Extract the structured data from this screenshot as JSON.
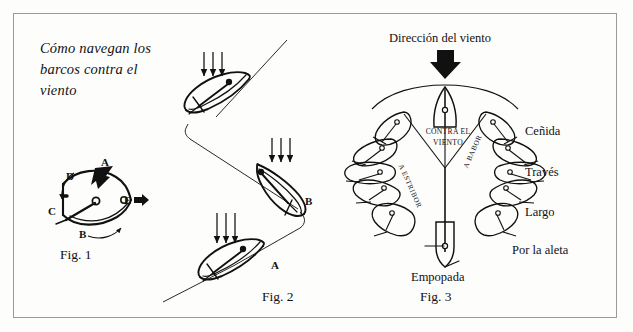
{
  "figure": {
    "title": "Cómo navegan los\nbarcos contra el\nviento",
    "background_color": "#fdfdfc",
    "ink_color": "#111111",
    "border_color": "#9a9a9a"
  },
  "fig1": {
    "caption": "Fig. 1",
    "labels": {
      "a": "A",
      "b": "B",
      "c": "C",
      "d": "D",
      "e": "E"
    }
  },
  "fig2": {
    "caption": "Fig. 2",
    "labels": {
      "a": "A",
      "b": "B"
    },
    "wind_arrow_groups": 3,
    "arrows_per_group": 3,
    "boat_count": 3
  },
  "fig3": {
    "caption": "Fig. 3",
    "wind_direction_label": "Dirección del viento",
    "center_label": "CONTRA EL\nVIENTO",
    "branch_labels": {
      "port": "A ESTRIBOR",
      "starboard": "A BABOR"
    },
    "points_of_sail": [
      "Ceñida",
      "Través",
      "Largo",
      "Por la aleta"
    ],
    "downwind_label": "Empopada",
    "boats_per_side": 4
  }
}
